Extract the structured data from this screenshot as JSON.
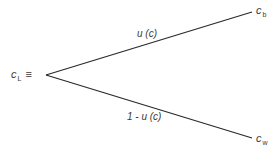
{
  "diagram": {
    "type": "lottery-tree",
    "origin": {
      "symbol": "c",
      "subscript": "L",
      "relation": "≡"
    },
    "branches": [
      {
        "label": "u (c)",
        "outcome": {
          "symbol": "c",
          "subscript": "b"
        }
      },
      {
        "label": "1 - u (c)",
        "outcome": {
          "symbol": "c",
          "subscript": "w"
        }
      }
    ],
    "colors": {
      "line": "#2a2a2a",
      "text": "#3a3a3a",
      "background": "#ffffff"
    }
  }
}
